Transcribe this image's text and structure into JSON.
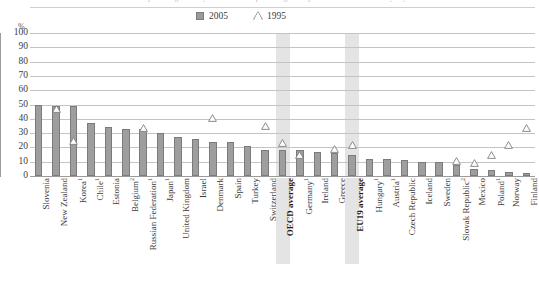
{
  "figure": {
    "top_caption": "percentage of 15-year-olds who report using a computer at home almost every day",
    "unit_label": "%"
  },
  "legend": {
    "position": "top-center",
    "items": [
      {
        "label": "2005",
        "marker": "square",
        "color": "#9a9a9a",
        "name": "legend-2005"
      },
      {
        "label": "1995",
        "marker": "triangle-outline",
        "color": "#8a8a8a",
        "name": "legend-1995"
      }
    ]
  },
  "chart_data": {
    "type": "bar",
    "title": "",
    "subtitle": "",
    "xlabel": "",
    "ylabel": "%",
    "ylim": [
      0,
      100
    ],
    "ytick_step": 10,
    "yticks": [
      100,
      90,
      80,
      70,
      60,
      50,
      40,
      30,
      20,
      10,
      0
    ],
    "grid": true,
    "legend_position": "top-center",
    "highlighted_categories": [
      "OECD average",
      "EU19 average"
    ],
    "categories": [
      "Slovenia",
      "New Zealand",
      "Korea¹",
      "Chile¹",
      "Estonia",
      "Belgium²",
      "Russian Federation¹",
      "Japan¹",
      "United Kingdom",
      "Israel",
      "Denmark",
      "Spain",
      "Turkey",
      "Switzerland",
      "OECD average",
      "Germany¹",
      "Ireland",
      "Greece",
      "EU19 average",
      "Hungary¹",
      "Austria¹",
      "Czech Republic",
      "Iceland",
      "Sweden",
      "Slovak Republic²",
      "Mexico",
      "Poland¹",
      "Norway",
      "Finland"
    ],
    "series": [
      {
        "name": "2005",
        "marker": "bar",
        "values": [
          50,
          49,
          49,
          37,
          34,
          33,
          33,
          30,
          27,
          26,
          24,
          24,
          21,
          18,
          18,
          18,
          17,
          16,
          15,
          12,
          12,
          11,
          10,
          10,
          8,
          5,
          4,
          3,
          2
        ]
      },
      {
        "name": "1995",
        "marker": "triangle",
        "values": [
          null,
          44,
          22,
          null,
          null,
          null,
          31,
          null,
          null,
          null,
          38,
          null,
          null,
          32,
          20,
          12,
          null,
          16,
          19,
          null,
          null,
          null,
          null,
          null,
          8,
          6,
          12,
          19,
          31
        ]
      }
    ]
  }
}
